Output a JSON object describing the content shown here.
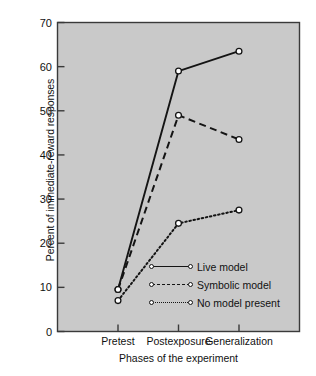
{
  "chart_data": {
    "type": "line",
    "title": "",
    "xlabel": "Phases of the experiment",
    "ylabel": "Percent of immediate-reward responses",
    "categories": [
      "Pretest",
      "Postexposure",
      "Generalization"
    ],
    "ylim": [
      0,
      70
    ],
    "yticks": [
      0,
      10,
      20,
      30,
      40,
      50,
      60,
      70
    ],
    "grid": false,
    "legend_position": "lower-right-inside",
    "plot_background": "#c9c9c9",
    "line_color": "#141414",
    "marker_fill": "#ffffff",
    "series": [
      {
        "name": "Live model",
        "style": "solid",
        "values": [
          9.5,
          59.0,
          63.5
        ]
      },
      {
        "name": "Symbolic model",
        "style": "dashed",
        "values": [
          9.5,
          49.0,
          43.5
        ]
      },
      {
        "name": "No model present",
        "style": "dotted",
        "values": [
          7.0,
          24.5,
          27.5
        ]
      }
    ]
  },
  "axis": {
    "ytick_labels": [
      "0",
      "10",
      "20",
      "30",
      "40",
      "50",
      "60",
      "70"
    ],
    "xtick_labels": [
      "Pretest",
      "Postexposure",
      "Generalization"
    ]
  }
}
